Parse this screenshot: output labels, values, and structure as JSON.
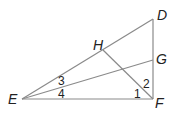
{
  "diagram": {
    "type": "geometry",
    "points": {
      "D": {
        "label": "D",
        "x": 153,
        "y": 19,
        "lx": 157,
        "ly": 20
      },
      "G": {
        "label": "G",
        "x": 153,
        "y": 60,
        "lx": 156,
        "ly": 64
      },
      "F": {
        "label": "F",
        "x": 153,
        "y": 99,
        "lx": 155,
        "ly": 108
      },
      "E": {
        "label": "E",
        "x": 22,
        "y": 99,
        "lx": 8,
        "ly": 104
      },
      "H": {
        "label": "H",
        "x": 103,
        "y": 50,
        "lx": 93,
        "ly": 50
      }
    },
    "segments": [
      [
        "E",
        "D"
      ],
      [
        "E",
        "G"
      ],
      [
        "E",
        "F"
      ],
      [
        "D",
        "F"
      ],
      [
        "H",
        "F"
      ]
    ],
    "angles": [
      {
        "label": "3",
        "x": 58,
        "y": 85
      },
      {
        "label": "4",
        "x": 58,
        "y": 98
      },
      {
        "label": "1",
        "x": 134,
        "y": 98
      },
      {
        "label": "2",
        "x": 143,
        "y": 88
      }
    ]
  }
}
